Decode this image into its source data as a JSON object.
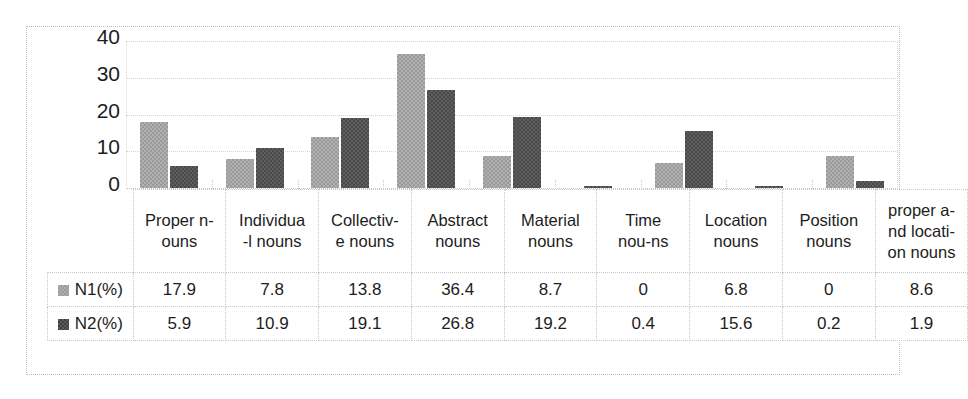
{
  "chart_data": {
    "type": "bar",
    "title": "",
    "subtitle": "",
    "xlabel": "",
    "ylabel": "",
    "ylim": [
      0,
      40
    ],
    "yticks": [
      "0",
      "10",
      "20",
      "30",
      "40"
    ],
    "grid": true,
    "legend_position": "table-left",
    "categories": [
      "Proper n-ouns",
      "Individua-l nouns",
      "Collectiv-e nouns",
      "Abstract nouns",
      "Material nouns",
      "Time nou-ns",
      "Location nouns",
      "Position nouns",
      "proper a-nd locati-on nouns"
    ],
    "category_lines": [
      [
        "Proper n-",
        "ouns"
      ],
      [
        "Individua",
        "-l nouns"
      ],
      [
        "Collectiv-",
        "e nouns"
      ],
      [
        "Abstract",
        "nouns"
      ],
      [
        "Material",
        "nouns"
      ],
      [
        "Time",
        "nou-ns"
      ],
      [
        "Location",
        "nouns"
      ],
      [
        "Position",
        "nouns"
      ],
      [
        "proper a-",
        "nd locati-",
        "on nouns"
      ]
    ],
    "series": [
      {
        "name": "N1(%)",
        "color": "#a6a6a6",
        "values": [
          17.9,
          7.8,
          13.8,
          36.4,
          8.7,
          0,
          6.8,
          0,
          8.6
        ],
        "labels": [
          "17.9",
          "7.8",
          "13.8",
          "36.4",
          "8.7",
          "0",
          "6.8",
          "0",
          "8.6"
        ]
      },
      {
        "name": "N2(%)",
        "color": "#595959",
        "values": [
          5.9,
          10.9,
          19.1,
          26.8,
          19.2,
          0.4,
          15.6,
          0.2,
          1.9
        ],
        "labels": [
          "5.9",
          "10.9",
          "19.1",
          "26.8",
          "19.2",
          "0.4",
          "15.6",
          "0.2",
          "1.9"
        ]
      }
    ]
  },
  "colors": {
    "series1": "#a6a6a6",
    "series2": "#595959",
    "gridline": "#d4d4d4",
    "border": "#c9c9c9",
    "text": "#1d1d1d",
    "background": "#ffffff"
  }
}
